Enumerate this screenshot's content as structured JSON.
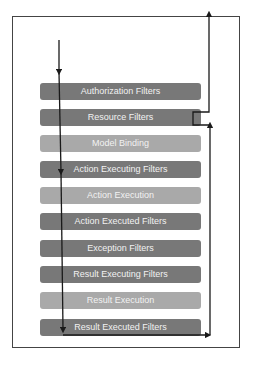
{
  "diagram": {
    "title": "",
    "stages": [
      {
        "label": "Authorization Filters",
        "shade": "dark"
      },
      {
        "label": "Resource Filters",
        "shade": "dark"
      },
      {
        "label": "Model Binding",
        "shade": "light"
      },
      {
        "label": "Action Executing Filters",
        "shade": "dark"
      },
      {
        "label": "Action Execution",
        "shade": "light"
      },
      {
        "label": "Action Executed Filters",
        "shade": "dark"
      },
      {
        "label": "Exception Filters",
        "shade": "dark"
      },
      {
        "label": "Result Executing Filters",
        "shade": "dark"
      },
      {
        "label": "Result Execution",
        "shade": "light"
      },
      {
        "label": "Result Executed Filters",
        "shade": "dark"
      }
    ],
    "flow": {
      "down_arrow": "request-flow-down",
      "up_arrow": "response-flow-up"
    },
    "colors": {
      "dark_stage": "#787878",
      "light_stage": "#a9a9a9",
      "stage_text": "#f2f2f2",
      "arrow": "#1a1a1a",
      "frame": "#444444"
    }
  }
}
